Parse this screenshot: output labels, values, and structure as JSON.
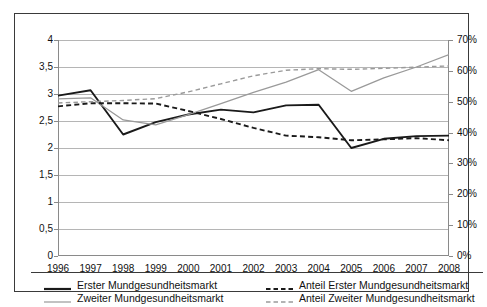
{
  "chart_data": {
    "type": "line",
    "title": "",
    "subtitle": "",
    "xlabel": "",
    "ylabel": "",
    "y2label": "",
    "grid": true,
    "legend_position": "bottom",
    "categories": [
      "1996",
      "1997",
      "1998",
      "1999",
      "2000",
      "2001",
      "2002",
      "2003",
      "2004",
      "2005",
      "2006",
      "2007",
      "2008"
    ],
    "ylim": [
      0,
      4
    ],
    "yticks": [
      "0",
      "0,5",
      "1",
      "1,5",
      "2",
      "2,5",
      "3",
      "3,5",
      "4"
    ],
    "ytick_values": [
      0,
      0.5,
      1,
      1.5,
      2,
      2.5,
      3,
      3.5,
      4
    ],
    "y2lim": [
      0,
      70
    ],
    "y2ticks": [
      "0%",
      "10%",
      "20%",
      "30%",
      "40%",
      "50%",
      "60%",
      "70%"
    ],
    "y2tick_values": [
      0,
      10,
      20,
      30,
      40,
      50,
      60,
      70
    ],
    "series": [
      {
        "name": "Erster Mundgesundheitsmarkt",
        "axis": "left",
        "style": "solid",
        "color": "#1a1a1a",
        "width": 1.9,
        "values": [
          2.97,
          3.07,
          2.25,
          2.48,
          2.62,
          2.71,
          2.66,
          2.79,
          2.8,
          2.0,
          2.17,
          2.22,
          2.23
        ]
      },
      {
        "name": "Zweiter Mundgesundheitsmarkt",
        "axis": "left",
        "style": "solid",
        "color": "#9a9a9a",
        "width": 1.3,
        "values": [
          2.91,
          2.93,
          2.52,
          2.43,
          2.62,
          2.82,
          3.03,
          3.22,
          3.45,
          3.05,
          3.3,
          3.5,
          3.73
        ]
      },
      {
        "name": "Anteil Erster Mundgesundheitsmarkt",
        "axis": "right",
        "style": "dashed",
        "color": "#1a1a1a",
        "width": 1.9,
        "values": [
          48.5,
          49.5,
          49.5,
          49.4,
          47.0,
          44.4,
          41.5,
          39.0,
          38.5,
          37.5,
          37.8,
          38.2,
          37.5
        ]
      },
      {
        "name": "Anteil Zweiter Mundgesundheitsmarkt",
        "axis": "right",
        "style": "dashed",
        "color": "#9a9a9a",
        "width": 1.4,
        "values": [
          49.6,
          50.0,
          50.4,
          51.0,
          53.2,
          55.8,
          58.4,
          60.2,
          60.7,
          60.5,
          60.8,
          61.2,
          61.6
        ]
      }
    ],
    "legend": [
      {
        "label": "Erster Mundgesundheitsmarkt",
        "style": "solid",
        "color": "#1a1a1a",
        "width": 2.2
      },
      {
        "label": "Zweiter Mundgesundheitsmarkt",
        "style": "solid",
        "color": "#9a9a9a",
        "width": 1.2
      },
      {
        "label": "Anteil Erster Mundgesundheitsmarkt",
        "style": "dashed",
        "color": "#1a1a1a",
        "width": 2.0
      },
      {
        "label": "Anteil Zweiter Mundgesundheitsmarkt",
        "style": "dashed",
        "color": "#9a9a9a",
        "width": 1.3
      }
    ],
    "colors": {
      "frame": "#3a3a3a",
      "grid": "#b5b5b5",
      "axis": "#8a8a8a",
      "text": "#111111",
      "background": "#ffffff"
    }
  }
}
